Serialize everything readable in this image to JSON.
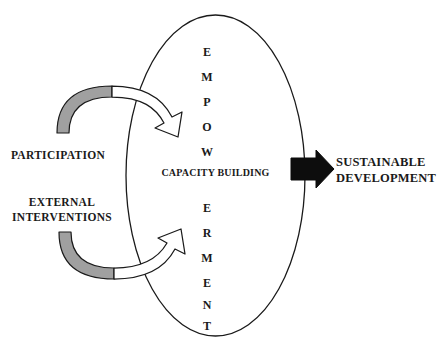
{
  "diagram": {
    "colors": {
      "outline": "#1a1a1a",
      "crescent_fill": "#a0a0a0",
      "arrow_fill": "#ffffff",
      "outcome_arrow_fill": "#0d0d0d",
      "background": "#ffffff"
    },
    "ellipse": {
      "center_label": "CAPACITY BUILDING",
      "vertical_word_top": [
        "E",
        "M",
        "P",
        "O",
        "W"
      ],
      "vertical_word_bottom": [
        "E",
        "R",
        "M",
        "E",
        "N",
        "T"
      ],
      "full_word": "EMPOWERMENT"
    },
    "inputs": [
      {
        "id": "participation",
        "label_lines": [
          "PARTICIPATION"
        ],
        "arrow_name": "curved-arrow-upper"
      },
      {
        "id": "external-interventions",
        "label_lines": [
          "EXTERNAL",
          "INTERVENTIONS"
        ],
        "arrow_name": "curved-arrow-lower"
      }
    ],
    "outcome": {
      "label_lines": [
        "SUSTAINABLE",
        "DEVELOPMENT"
      ],
      "arrow_name": "outcome-arrow"
    }
  }
}
